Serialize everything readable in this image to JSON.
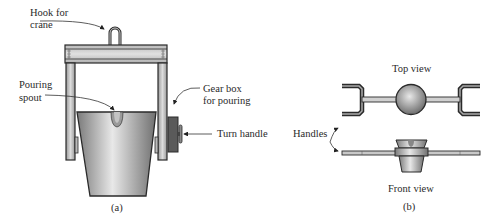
{
  "figure_a": {
    "caption": "(a)",
    "labels": {
      "hook_line1": "Hook for",
      "hook_line2": "crane",
      "spout_line1": "Pouring",
      "spout_line2": "spout",
      "gear_line1": "Gear box",
      "gear_line2": "for pouring",
      "turn_handle": "Turn handle"
    }
  },
  "figure_b": {
    "caption": "(b)",
    "labels": {
      "top_view": "Top view",
      "front_view": "Front view",
      "handles": "Handles"
    }
  },
  "colors": {
    "outline": "#2a2a2a",
    "frame_fill": "#c8c8c8",
    "ladle_light": "#e6e6e6",
    "ladle_dark": "#7a7a7a",
    "gearbox": "#555555"
  }
}
